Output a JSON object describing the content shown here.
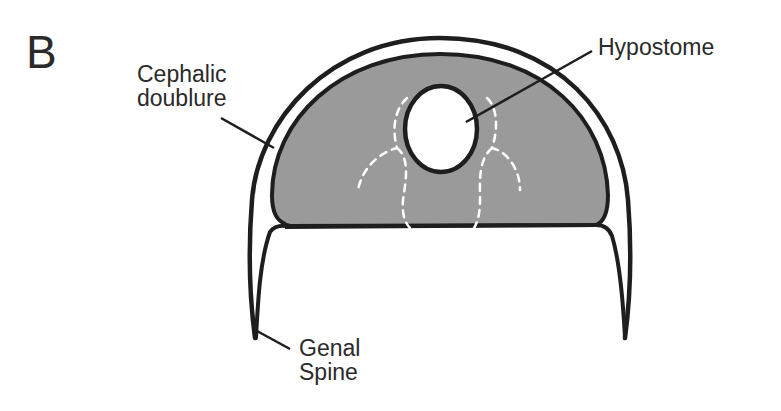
{
  "figure": {
    "panel_letter": "B",
    "labels": {
      "cephalic_doublure": [
        "Cephalic",
        "doublure"
      ],
      "hypostome": "Hypostome",
      "genal_spine": [
        "Genal",
        "Spine"
      ]
    },
    "colors": {
      "outline": "#1e1e1e",
      "doublure_fill": "#9a9a9a",
      "hypostome_fill": "#ffffff",
      "dashed_lines": "#ffffff",
      "text": "#2a2a2a"
    }
  }
}
